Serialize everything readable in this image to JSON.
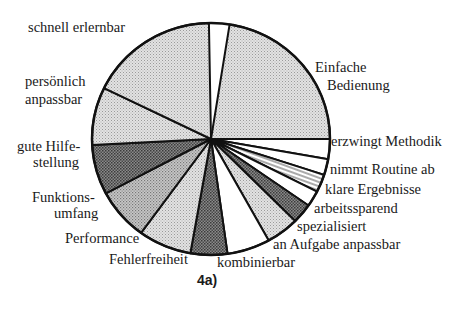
{
  "caption": "4a)",
  "chart_data": {
    "type": "pie",
    "title": "4a)",
    "center": [
      211,
      139
    ],
    "radius": [
      119,
      116
    ],
    "start_angle_deg": -81,
    "direction": "clockwise",
    "slices": [
      {
        "label": "Einfache Bedienung",
        "value": 81,
        "fill": "light-dotted"
      },
      {
        "label": "erzwingt Methodik",
        "value": 10,
        "fill": "white"
      },
      {
        "label": "nimmt Routine ab",
        "value": 8,
        "fill": "white"
      },
      {
        "label": "klare Ergebnisse",
        "value": 9,
        "fill": "hatched"
      },
      {
        "label": "arbeitssparend",
        "value": 8,
        "fill": "white"
      },
      {
        "label": "spezialisiert",
        "value": 10,
        "fill": "dark-dotted"
      },
      {
        "label": "an Aufgabe anpassbar",
        "value": 16,
        "fill": "light-dotted"
      },
      {
        "label": "kombinierbar",
        "value": 21,
        "fill": "white"
      },
      {
        "label": "Fehlerfreiheit",
        "value": 18,
        "fill": "dark-dotted"
      },
      {
        "label": "Performance",
        "value": 26,
        "fill": "light-dotted"
      },
      {
        "label": "Funktionsumfang",
        "value": 26,
        "fill": "medium-dotted"
      },
      {
        "label": "gute Hilfestellung",
        "value": 25,
        "fill": "dark-dotted"
      },
      {
        "label": "persönlich anpassbar",
        "value": 29,
        "fill": "light-dotted"
      },
      {
        "label": "schnell erlernbar",
        "value": 63,
        "fill": "light-dotted"
      }
    ],
    "units": "degrees (estimated from image)",
    "legend": "none (labels placed around pie)"
  },
  "labels": {
    "schnell": "schnell erlernbar",
    "persoenlich_1": "persönlich",
    "persoenlich_2": "anpassbar",
    "hilfe_1": "gute Hilfe-",
    "hilfe_2": "stellung",
    "funktion_1": "Funktions-",
    "funktion_2": "umfang",
    "performance": "Performance",
    "fehler": "Fehlerfreiheit",
    "kombinierbar": "kombinierbar",
    "aufgabe": "an Aufgabe anpassbar",
    "spezialisiert": "spezialisiert",
    "arbeitssparend": "arbeitssparend",
    "klare": "klare Ergebnisse",
    "routine": "nimmt  Routine ab",
    "methodik": "erzwingt  Methodik",
    "einfache_1": "Einfache",
    "einfache_2": "Bedienung"
  }
}
